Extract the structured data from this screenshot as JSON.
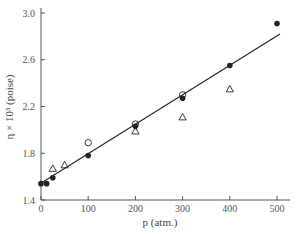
{
  "chart_data": {
    "type": "scatter",
    "title": "",
    "xlabel": "p (atm.)",
    "ylabel": "η × 10³ (poise)",
    "xlim": [
      0,
      500
    ],
    "ylim": [
      1.4,
      3.0
    ],
    "x_ticks": [
      0,
      100,
      200,
      300,
      400,
      500
    ],
    "x_tick_labels": [
      "0",
      "100",
      "200",
      "300",
      "400",
      "500"
    ],
    "y_ticks": [
      1.4,
      1.8,
      2.2,
      2.6,
      3.0
    ],
    "y_tick_labels": [
      "1.4",
      "1.8",
      "2.2",
      "2.6",
      "3.0"
    ],
    "grid": false,
    "legend": null,
    "series": [
      {
        "name": "filled circles",
        "marker": "filled-circle",
        "points": [
          {
            "x": 0,
            "y": 1.54
          },
          {
            "x": 12,
            "y": 1.54
          },
          {
            "x": 25,
            "y": 1.59
          },
          {
            "x": 100,
            "y": 1.78
          },
          {
            "x": 200,
            "y": 2.03
          },
          {
            "x": 300,
            "y": 2.27
          },
          {
            "x": 400,
            "y": 2.55
          },
          {
            "x": 500,
            "y": 2.91
          }
        ]
      },
      {
        "name": "open circles",
        "marker": "open-circle",
        "points": [
          {
            "x": 100,
            "y": 1.89
          },
          {
            "x": 200,
            "y": 2.05
          },
          {
            "x": 300,
            "y": 2.3
          }
        ]
      },
      {
        "name": "open triangles",
        "marker": "open-triangle",
        "points": [
          {
            "x": 25,
            "y": 1.67
          },
          {
            "x": 50,
            "y": 1.7
          },
          {
            "x": 200,
            "y": 1.99
          },
          {
            "x": 300,
            "y": 2.11
          },
          {
            "x": 400,
            "y": 2.35
          }
        ]
      }
    ],
    "fit_line": {
      "x": [
        0,
        500
      ],
      "y": [
        1.55,
        2.82
      ]
    }
  },
  "colors": {
    "ink": "#222222",
    "axis": "#555555"
  }
}
